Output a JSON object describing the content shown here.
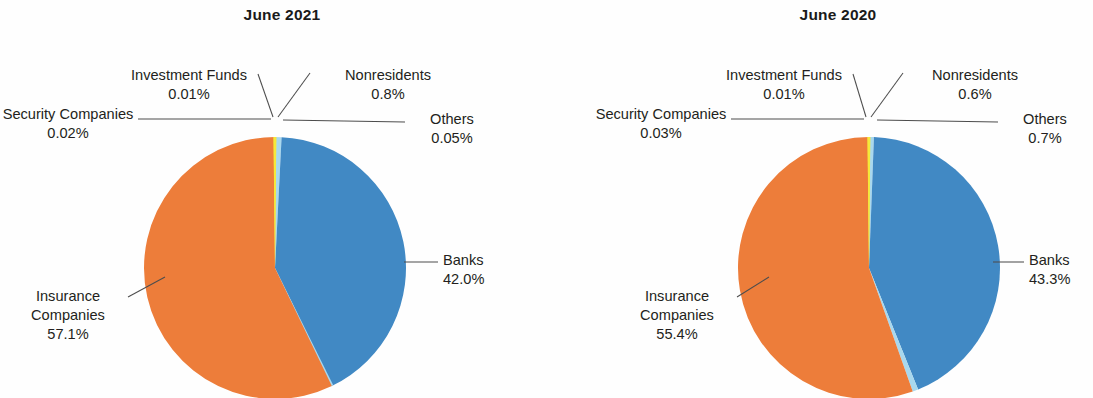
{
  "charts": [
    {
      "title": "June 2021",
      "labels": {
        "investment_funds": {
          "name": "Investment Funds",
          "value": "0.01%"
        },
        "nonresidents": {
          "name": "Nonresidents",
          "value": "0.8%"
        },
        "security_companies": {
          "name": "Security Companies",
          "value": "0.02%"
        },
        "others": {
          "name": "Others",
          "value": "0.05%"
        },
        "banks": {
          "name": "Banks",
          "value": "42.0%"
        },
        "insurance_line1": "Insurance",
        "insurance_line2": "Companies",
        "insurance_value": "57.1%"
      }
    },
    {
      "title": "June 2020",
      "labels": {
        "investment_funds": {
          "name": "Investment Funds",
          "value": "0.01%"
        },
        "nonresidents": {
          "name": "Nonresidents",
          "value": "0.6%"
        },
        "security_companies": {
          "name": "Security Companies",
          "value": "0.03%"
        },
        "others": {
          "name": "Others",
          "value": "0.7%"
        },
        "banks": {
          "name": "Banks",
          "value": "43.3%"
        },
        "insurance_line1": "Insurance",
        "insurance_line2": "Companies",
        "insurance_value": "55.4%"
      }
    }
  ],
  "colors": {
    "insurance_companies": "#ED7D3A",
    "banks": "#4189C4",
    "investment_funds": "#F5E93B",
    "nonresidents": "#A8D8EE",
    "security_companies": "#F5E93B",
    "others": "#A8D8EE",
    "leader_line": "#4d4d4d",
    "text": "#231f20",
    "background": "#ffffff"
  },
  "chart_data": [
    {
      "type": "pie",
      "title": "June 2021",
      "categories": [
        "Insurance Companies",
        "Banks",
        "Nonresidents",
        "Others",
        "Security Companies",
        "Investment Funds"
      ],
      "values": [
        57.1,
        42.0,
        0.8,
        0.05,
        0.02,
        0.01
      ],
      "value_labels": [
        "57.1%",
        "42.0%",
        "0.8%",
        "0.05%",
        "0.02%",
        "0.01%"
      ],
      "colors": [
        "#ED7D3A",
        "#4189C4",
        "#A8D8EE",
        "#A8D8EE",
        "#F5E93B",
        "#F5E93B"
      ],
      "start_angle_deg": 0,
      "direction": "clockwise",
      "legend": "labels-with-leader-lines",
      "grid": false,
      "xlabel": "",
      "ylabel": ""
    },
    {
      "type": "pie",
      "title": "June 2020",
      "categories": [
        "Insurance Companies",
        "Banks",
        "Nonresidents",
        "Others",
        "Security Companies",
        "Investment Funds"
      ],
      "values": [
        55.4,
        43.3,
        0.6,
        0.7,
        0.03,
        0.01
      ],
      "value_labels": [
        "55.4%",
        "43.3%",
        "0.6%",
        "0.7%",
        "0.03%",
        "0.01%"
      ],
      "colors": [
        "#ED7D3A",
        "#4189C4",
        "#A8D8EE",
        "#A8D8EE",
        "#F5E93B",
        "#F5E93B"
      ],
      "start_angle_deg": 0,
      "direction": "clockwise",
      "legend": "labels-with-leader-lines",
      "grid": false,
      "xlabel": "",
      "ylabel": ""
    }
  ]
}
